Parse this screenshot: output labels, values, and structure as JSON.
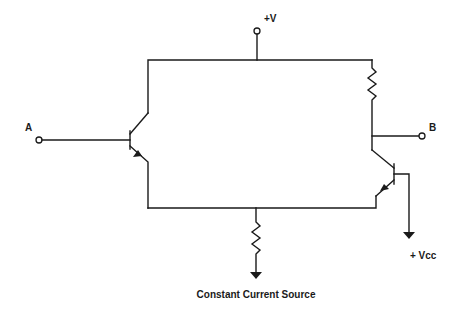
{
  "diagram": {
    "type": "circuit-schematic",
    "labels": {
      "input_a": "A",
      "output_b": "B",
      "supply_top": "+V",
      "supply_vcc": "+ Vcc",
      "current_source": "Constant Current Source"
    },
    "components": [
      {
        "id": "Q1",
        "kind": "NPN transistor",
        "position": "left"
      },
      {
        "id": "Q2",
        "kind": "NPN transistor",
        "position": "right"
      },
      {
        "id": "R1",
        "kind": "resistor",
        "position": "right collector load"
      },
      {
        "id": "R2",
        "kind": "resistor",
        "position": "bottom emitter tail"
      }
    ],
    "terminals": [
      "A",
      "B",
      "+V",
      "+ Vcc",
      "ground-arrow (tail)"
    ],
    "colors": {
      "ink": "#1a1a1a",
      "background": "#ffffff"
    }
  }
}
